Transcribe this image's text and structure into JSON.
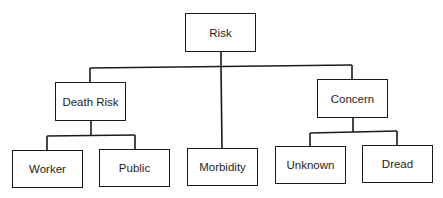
{
  "diagram": {
    "type": "hierarchy-tree",
    "root": {
      "label": "Risk",
      "children": [
        {
          "label": "Death Risk",
          "children": [
            {
              "label": "Worker"
            },
            {
              "label": "Public"
            }
          ]
        },
        {
          "label": "Morbidity"
        },
        {
          "label": "Concern",
          "children": [
            {
              "label": "Unknown"
            },
            {
              "label": "Dread"
            }
          ]
        }
      ]
    },
    "nodes": {
      "risk": "Risk",
      "death_risk": "Death Risk",
      "concern": "Concern",
      "worker": "Worker",
      "public": "Public",
      "morbidity": "Morbidity",
      "unknown": "Unknown",
      "dread": "Dread"
    },
    "colors": {
      "line": "#1a1a1a",
      "text": "#1e1e1e",
      "background": "#ffffff"
    }
  }
}
